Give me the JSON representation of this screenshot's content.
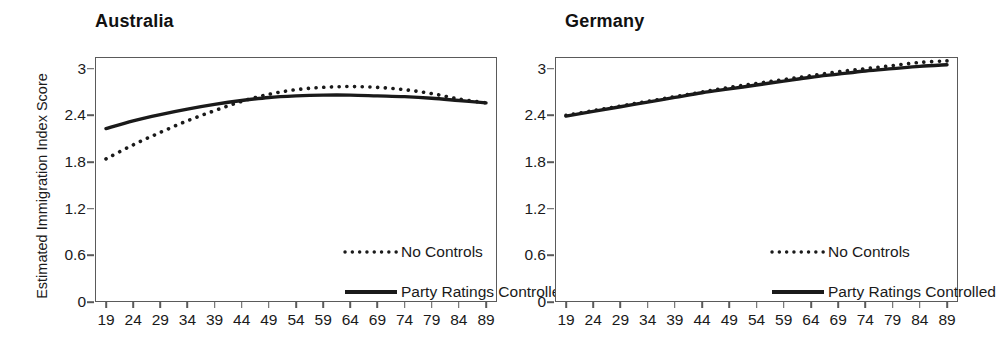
{
  "figure": {
    "ylabel": "Estimated Immigration Index Score"
  },
  "panels": [
    {
      "title": "Australia",
      "legend": [
        {
          "label": "No Controls",
          "style": "dotted"
        },
        {
          "label": "Party Ratings Controlled",
          "style": "solid"
        }
      ]
    },
    {
      "title": "Germany",
      "legend": [
        {
          "label": "No Controls",
          "style": "dotted"
        },
        {
          "label": "Party Ratings Controlled",
          "style": "solid"
        }
      ]
    }
  ],
  "chart_data": [
    {
      "type": "line",
      "title": "Australia",
      "xlabel": "",
      "ylabel": "Estimated Immigration Index Score",
      "xlim": [
        19,
        89
      ],
      "ylim": [
        0,
        3.15
      ],
      "grid": false,
      "legend_position": "inside-center",
      "xticks": [
        19,
        24,
        29,
        34,
        39,
        44,
        49,
        54,
        59,
        64,
        69,
        74,
        79,
        84,
        89
      ],
      "yticks": [
        0,
        0.6,
        1.2,
        1.8,
        2.4,
        3
      ],
      "ytick_labels": [
        "0",
        "0.6",
        "1.2",
        "1.8",
        "2.4",
        "3"
      ],
      "x": [
        19,
        24,
        29,
        34,
        39,
        44,
        49,
        54,
        59,
        64,
        69,
        74,
        79,
        84,
        89
      ],
      "series": [
        {
          "name": "No Controls",
          "style": "dotted",
          "color": "#1a1a1a",
          "values": [
            1.84,
            2.02,
            2.18,
            2.33,
            2.46,
            2.58,
            2.67,
            2.73,
            2.76,
            2.77,
            2.76,
            2.73,
            2.68,
            2.61,
            2.56
          ]
        },
        {
          "name": "Party Ratings Controlled",
          "style": "solid",
          "color": "#1a1a1a",
          "values": [
            2.23,
            2.33,
            2.41,
            2.48,
            2.54,
            2.59,
            2.63,
            2.65,
            2.66,
            2.66,
            2.65,
            2.64,
            2.62,
            2.59,
            2.56
          ]
        }
      ]
    },
    {
      "type": "line",
      "title": "Germany",
      "xlabel": "",
      "ylabel": "",
      "xlim": [
        19,
        89
      ],
      "ylim": [
        0,
        3.15
      ],
      "grid": false,
      "legend_position": "inside-center",
      "xticks": [
        19,
        24,
        29,
        34,
        39,
        44,
        49,
        54,
        59,
        64,
        69,
        74,
        79,
        84,
        89
      ],
      "yticks": [
        0,
        0.6,
        1.2,
        1.8,
        2.4,
        3
      ],
      "ytick_labels": [
        "0",
        "0.6",
        "1.2",
        "1.8",
        "2.4",
        "3"
      ],
      "x": [
        19,
        24,
        29,
        34,
        39,
        44,
        49,
        54,
        59,
        64,
        69,
        74,
        79,
        84,
        89
      ],
      "series": [
        {
          "name": "No Controls",
          "style": "dotted",
          "color": "#1a1a1a",
          "values": [
            2.4,
            2.46,
            2.52,
            2.58,
            2.64,
            2.7,
            2.76,
            2.81,
            2.86,
            2.91,
            2.96,
            3.0,
            3.04,
            3.08,
            3.1
          ]
        },
        {
          "name": "Party Ratings Controlled",
          "style": "solid",
          "color": "#1a1a1a",
          "values": [
            2.39,
            2.45,
            2.51,
            2.57,
            2.63,
            2.69,
            2.74,
            2.79,
            2.84,
            2.89,
            2.93,
            2.97,
            3.0,
            3.03,
            3.05
          ]
        }
      ]
    }
  ]
}
